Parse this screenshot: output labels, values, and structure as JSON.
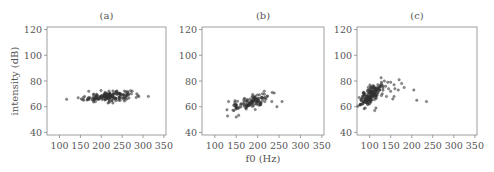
{
  "chart_data": [
    {
      "type": "scatter",
      "title": "(a)",
      "xlabel": "",
      "ylabel": "intensity (dB)",
      "xlim": [
        70,
        355
      ],
      "ylim": [
        38,
        122
      ],
      "xticks": [
        100,
        150,
        200,
        250,
        300,
        350
      ],
      "yticks": [
        40,
        60,
        80,
        100,
        120
      ],
      "grid": false,
      "clusters": [
        {
          "n": 170,
          "x_mean": 215,
          "x_sd": 28,
          "y_mean": 68,
          "y_sd": 1.8,
          "slope": 0.03
        },
        {
          "n": 10,
          "x_mean": 250,
          "x_sd": 30,
          "y_mean": 69,
          "y_sd": 2.5,
          "slope": 0.0
        }
      ],
      "extra_points": [
        [
          152,
          66
        ],
        [
          160,
          68
        ],
        [
          285,
          70
        ],
        [
          290,
          68
        ],
        [
          170,
          72
        ]
      ]
    },
    {
      "type": "scatter",
      "title": "(b)",
      "xlabel": "f0 (Hz)",
      "ylabel": "",
      "xlim": [
        70,
        355
      ],
      "ylim": [
        38,
        122
      ],
      "xticks": [
        100,
        150,
        200,
        250,
        300,
        350
      ],
      "yticks": [
        40,
        60,
        80,
        100,
        120
      ],
      "grid": false,
      "clusters": [
        {
          "n": 110,
          "x_mean": 188,
          "x_sd": 18,
          "y_mean": 64,
          "y_sd": 2.6,
          "slope": 0.09
        },
        {
          "n": 14,
          "x_mean": 148,
          "x_sd": 4,
          "y_mean": 61,
          "y_sd": 2.5,
          "slope": 0.0
        }
      ],
      "extra_points": [
        [
          132,
          64
        ],
        [
          150,
          52
        ],
        [
          233,
          64
        ],
        [
          245,
          60
        ],
        [
          257,
          64
        ],
        [
          222,
          68
        ]
      ]
    },
    {
      "type": "scatter",
      "title": "(c)",
      "xlabel": "",
      "ylabel": "",
      "xlim": [
        70,
        355
      ],
      "ylim": [
        38,
        122
      ],
      "xticks": [
        100,
        150,
        200,
        250,
        300,
        350
      ],
      "yticks": [
        40,
        60,
        80,
        100,
        120
      ],
      "grid": false,
      "clusters": [
        {
          "n": 190,
          "x_mean": 103,
          "x_sd": 13,
          "y_mean": 69,
          "y_sd": 3.2,
          "slope": 0.22
        }
      ],
      "extra_points": [
        [
          128,
          79
        ],
        [
          135,
          80
        ],
        [
          143,
          79
        ],
        [
          150,
          79
        ],
        [
          158,
          77
        ],
        [
          170,
          81
        ],
        [
          176,
          78
        ],
        [
          182,
          75
        ],
        [
          160,
          74
        ],
        [
          168,
          73
        ],
        [
          145,
          74
        ],
        [
          150,
          72
        ],
        [
          138,
          76
        ],
        [
          155,
          66
        ],
        [
          158,
          68
        ],
        [
          205,
          73
        ],
        [
          212,
          65
        ],
        [
          235,
          64
        ],
        [
          112,
          57
        ],
        [
          115,
          59
        ],
        [
          130,
          70
        ],
        [
          140,
          68
        ]
      ]
    }
  ],
  "style": {
    "marker_color": "#333333",
    "axis_color": "#888888",
    "text_color": "#555555"
  }
}
